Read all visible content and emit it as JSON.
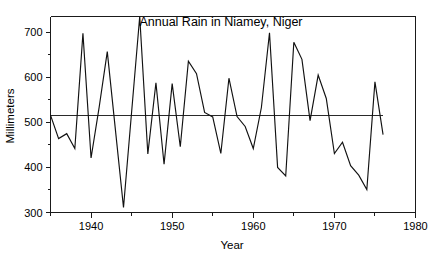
{
  "chart_data": {
    "type": "line",
    "title": "Annual Rain in Niamey, Niger",
    "xlabel": "Year",
    "ylabel": "Millimeters",
    "xlim": [
      1935,
      1980
    ],
    "ylim": [
      300,
      735
    ],
    "grid": false,
    "legend_position": "none",
    "x_ticks_major": [
      1940,
      1950,
      1960,
      1970,
      1980
    ],
    "x_tick_labels": [
      "1940",
      "1950",
      "1960",
      "1970",
      "1980"
    ],
    "x_ticks_minor": [
      1935,
      1945,
      1955,
      1965,
      1975
    ],
    "y_ticks_major": [
      300,
      400,
      500,
      600,
      700
    ],
    "y_tick_labels": [
      "300",
      "400",
      "500",
      "600",
      "700"
    ],
    "y_ticks_minor": [
      350,
      450,
      550,
      650
    ],
    "series": [
      {
        "name": "Annual rainfall",
        "x": [
          1935,
          1936,
          1937,
          1938,
          1939,
          1940,
          1941,
          1942,
          1943,
          1944,
          1945,
          1946,
          1947,
          1948,
          1949,
          1950,
          1951,
          1952,
          1953,
          1954,
          1955,
          1956,
          1957,
          1958,
          1959,
          1960,
          1961,
          1962,
          1963,
          1964,
          1965,
          1966,
          1967,
          1968,
          1969,
          1970,
          1971,
          1972,
          1973,
          1974,
          1975,
          1976
        ],
        "values": [
          516,
          464,
          475,
          442,
          698,
          421,
          534,
          657,
          484,
          311,
          523,
          735,
          430,
          588,
          407,
          586,
          446,
          636,
          608,
          522,
          512,
          431,
          598,
          513,
          491,
          442,
          533,
          699,
          400,
          381,
          678,
          640,
          504,
          605,
          553,
          431,
          456,
          404,
          383,
          351,
          590,
          473
        ]
      }
    ],
    "annotations": [
      {
        "type": "horizontal-mean-line",
        "value": 515,
        "label": "mean reference line",
        "color": "#2a2a2a",
        "x_start": 1935,
        "x_end": 1976
      }
    ],
    "colors": {
      "line": "#111111",
      "mean": "#2a2a2a",
      "axis": "#1a1a1a",
      "background": "#ffffff",
      "text": "#000000"
    }
  }
}
